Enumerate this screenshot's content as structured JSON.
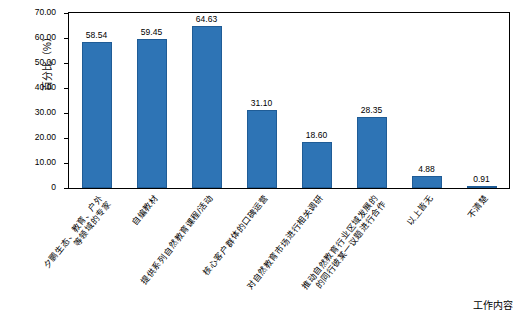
{
  "chart_data": {
    "type": "bar",
    "title": "",
    "subtitle": "",
    "xlabel": "工作内容",
    "ylabel": "百分比（%）",
    "ylim": [
      0,
      70
    ],
    "ytick_labels": [
      "0",
      "10.00",
      "20.00",
      "30.00",
      "40.00",
      "50.00",
      "60.00",
      "70.00"
    ],
    "ytick_values": [
      0,
      10,
      20,
      30,
      40,
      50,
      60,
      70
    ],
    "grid": false,
    "legend": "none",
    "bar_color": "#2E74B5",
    "categories": [
      "夕鹏生态、教育、户外\n等领域的专家",
      "自编教材",
      "提供系列自然教育课程/活动",
      "核心客户群体的口碑运营",
      "对自然教育市场进行相关调研",
      "推动自然教育行业区域发展的\n的同行彼某一议题进行合作",
      "以上皆无",
      "不清楚"
    ],
    "values": [
      58.54,
      59.45,
      64.63,
      31.1,
      18.6,
      28.35,
      4.88,
      0.91
    ],
    "value_labels": [
      "58.54",
      "59.45",
      "64.63",
      "31.10",
      "18.60",
      "28.35",
      "4.88",
      "0.91"
    ]
  }
}
